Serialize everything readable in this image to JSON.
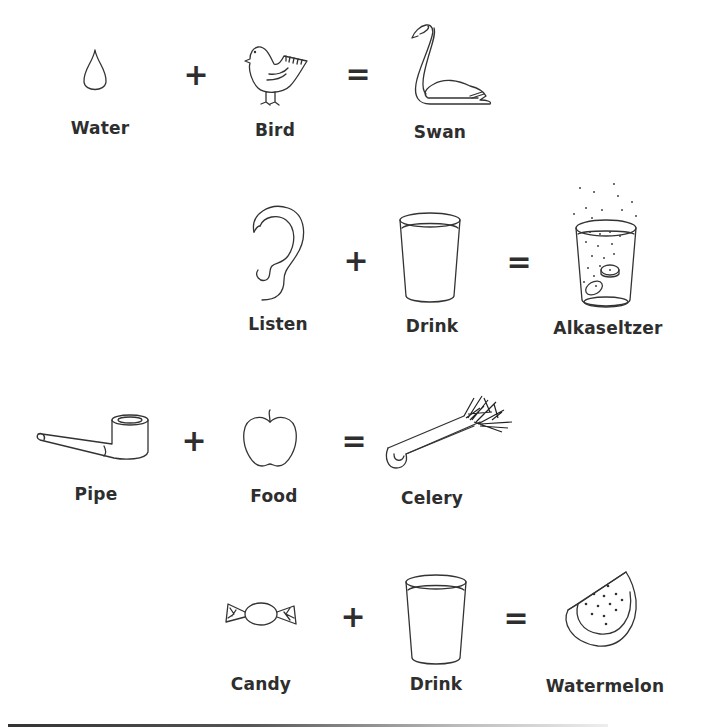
{
  "equations": [
    {
      "terms": [
        {
          "label": "Water",
          "icon": "water-drop-icon"
        },
        {
          "label": "Bird",
          "icon": "bird-icon"
        },
        {
          "label": "Swan",
          "icon": "swan-icon"
        }
      ],
      "plus": "+",
      "equals": "="
    },
    {
      "terms": [
        {
          "label": "Listen",
          "icon": "ear-icon"
        },
        {
          "label": "Drink",
          "icon": "glass-icon"
        },
        {
          "label": "Alkaseltzer",
          "icon": "fizzing-glass-icon"
        }
      ],
      "plus": "+",
      "equals": "="
    },
    {
      "terms": [
        {
          "label": "Pipe",
          "icon": "pipe-icon"
        },
        {
          "label": "Food",
          "icon": "apple-icon"
        },
        {
          "label": "Celery",
          "icon": "celery-icon"
        }
      ],
      "plus": "+",
      "equals": "="
    },
    {
      "terms": [
        {
          "label": "Candy",
          "icon": "candy-icon"
        },
        {
          "label": "Drink",
          "icon": "glass-icon"
        },
        {
          "label": "Watermelon",
          "icon": "watermelon-icon"
        }
      ],
      "plus": "+",
      "equals": "="
    }
  ]
}
